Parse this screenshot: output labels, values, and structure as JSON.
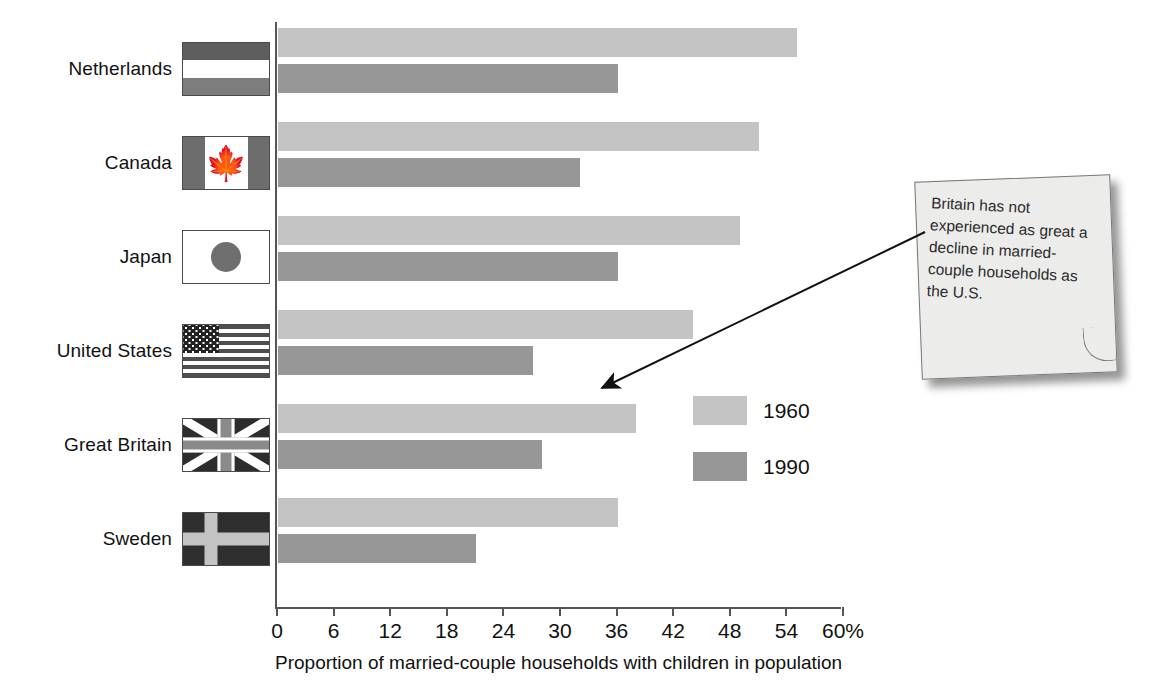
{
  "chart_data": {
    "type": "bar",
    "orientation": "horizontal",
    "title": "",
    "xlabel": "Proportion of married-couple households with children in population",
    "ylabel": "",
    "xlim": [
      0,
      60
    ],
    "xticks": [
      "0",
      "6",
      "12",
      "18",
      "24",
      "30",
      "36",
      "42",
      "48",
      "54",
      "60%"
    ],
    "xtick_values": [
      0,
      6,
      12,
      18,
      24,
      30,
      36,
      42,
      48,
      54,
      60
    ],
    "grid": false,
    "legend_position": "inside-right",
    "categories": [
      "Netherlands",
      "Canada",
      "Japan",
      "United States",
      "Great Britain",
      "Sweden"
    ],
    "series": [
      {
        "name": "1960",
        "color": "#c4c4c4",
        "values": [
          55,
          51,
          49,
          44,
          38,
          36
        ]
      },
      {
        "name": "1990",
        "color": "#979797",
        "values": [
          36,
          32,
          36,
          27,
          28,
          21
        ]
      }
    ]
  },
  "flags": [
    {
      "country": "Netherlands",
      "icon": "flag-netherlands-icon"
    },
    {
      "country": "Canada",
      "icon": "flag-canada-icon"
    },
    {
      "country": "Japan",
      "icon": "flag-japan-icon"
    },
    {
      "country": "United States",
      "icon": "flag-united-states-icon"
    },
    {
      "country": "Great Britain",
      "icon": "flag-great-britain-icon"
    },
    {
      "country": "Sweden",
      "icon": "flag-sweden-icon"
    }
  ],
  "annotation": {
    "text": "Britain has not experienced as great a decline in married-couple households as the U.S.",
    "style": "sticky-note",
    "points_to": "Great Britain"
  },
  "colors": {
    "series_1960": "#c4c4c4",
    "series_1990": "#979797",
    "axis": "#555555",
    "text": "#111111",
    "note_background": "#ececea"
  }
}
